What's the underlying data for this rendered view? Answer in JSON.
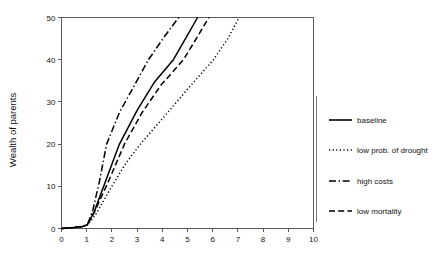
{
  "chart_data": {
    "type": "line",
    "title": "",
    "subtitle": "",
    "xlabel": "",
    "ylabel": "Wealth of parents",
    "xlim": [
      0,
      10
    ],
    "ylim": [
      0,
      50
    ],
    "grid": false,
    "legend_position": "right",
    "xticks": [
      "0",
      "1",
      "2",
      "3",
      "4",
      "5",
      "6",
      "7",
      "8",
      "9",
      "10"
    ],
    "xtick_values": [
      0,
      1,
      2,
      3,
      4,
      5,
      6,
      7,
      8,
      9,
      10
    ],
    "yticks": [
      "0",
      "10",
      "20",
      "30",
      "40",
      "50"
    ],
    "ytick_values": [
      0,
      10,
      20,
      30,
      40,
      50
    ],
    "series": [
      {
        "name": "baseline",
        "dash": "solid",
        "x": [
          0,
          0.5,
          0.85,
          1.03,
          1.3,
          1.8,
          2.3,
          3.0,
          3.7,
          4.44,
          5.0,
          5.4
        ],
        "y": [
          0,
          0.25,
          0.5,
          0.9,
          4.0,
          12.0,
          20.0,
          28.0,
          34.8,
          40.0,
          45.8,
          50.0
        ]
      },
      {
        "name": "low prob. of drought",
        "dash": "dotted",
        "x": [
          0,
          0.5,
          0.85,
          1.03,
          1.35,
          1.9,
          2.5,
          3.13,
          4.0,
          5.0,
          6.03,
          6.6,
          7.05
        ],
        "y": [
          0,
          0.25,
          0.5,
          0.9,
          3.2,
          9.0,
          15.0,
          20.0,
          26.0,
          33.0,
          40.0,
          45.0,
          50.0
        ]
      },
      {
        "name": "high costs",
        "dash": "dashdot",
        "x": [
          0,
          0.5,
          0.85,
          1.03,
          1.25,
          1.5,
          1.79,
          2.3,
          2.9,
          3.45,
          4.1,
          4.65
        ],
        "y": [
          0,
          0.25,
          0.5,
          0.9,
          4.5,
          11.0,
          20.0,
          27.5,
          34.0,
          40.0,
          45.6,
          50.0
        ]
      },
      {
        "name": "low mortality",
        "dash": "dashed",
        "x": [
          0,
          0.5,
          0.85,
          1.03,
          1.3,
          1.85,
          2.5,
          3.2,
          3.95,
          4.84,
          5.4,
          5.85
        ],
        "y": [
          0,
          0.25,
          0.5,
          0.9,
          3.8,
          11.0,
          20.0,
          27.5,
          34.0,
          40.0,
          45.5,
          50.0
        ]
      }
    ]
  },
  "legend": {
    "items": [
      {
        "label": "baseline",
        "dash": "solid"
      },
      {
        "label": "low prob. of drought",
        "dash": "dotted"
      },
      {
        "label": "high costs",
        "dash": "dashdot"
      },
      {
        "label": "low mortality",
        "dash": "dashed"
      }
    ]
  },
  "colors": {
    "ink": "#000000",
    "axis": "#5a5a5a",
    "background": "#ffffff"
  }
}
